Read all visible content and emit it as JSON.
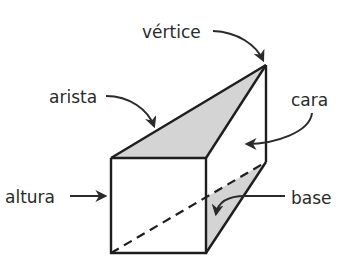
{
  "diagram": {
    "labels": {
      "vertex": "vértice",
      "edge": "arista",
      "face": "cara",
      "height": "altura",
      "base": "base"
    },
    "colors": {
      "shade": "#d4d4d4",
      "line": "#1e1e1e",
      "text": "#2a2a2a",
      "background": "#ffffff"
    }
  }
}
